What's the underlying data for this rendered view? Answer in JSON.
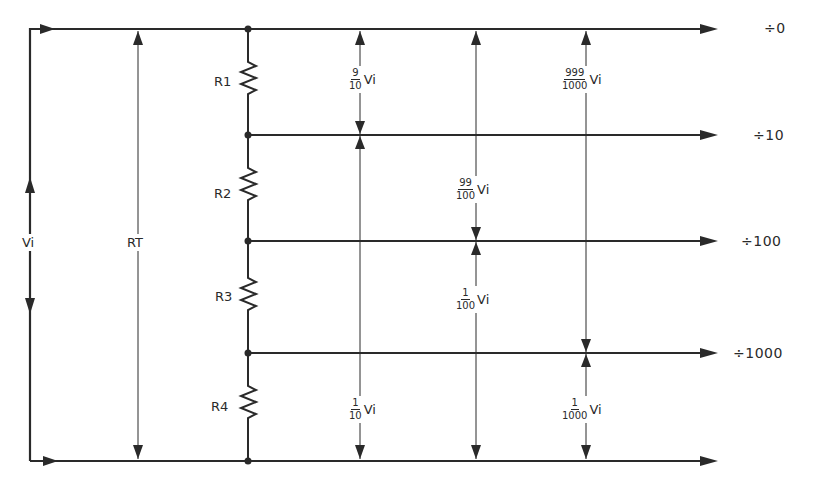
{
  "diagram": {
    "title": "",
    "input": {
      "voltage_label": "Vi",
      "total_resistance_label": "RT",
      "total_resistance_sub": "T"
    },
    "resistors": [
      {
        "label": "R1"
      },
      {
        "label": "R2"
      },
      {
        "label": "R3"
      },
      {
        "label": "R4"
      }
    ],
    "outputs": [
      {
        "label": "÷0"
      },
      {
        "label": "÷10"
      },
      {
        "label": "÷100"
      },
      {
        "label": "÷1000"
      }
    ],
    "dimensions": {
      "col1": [
        {
          "num": "9",
          "den": "10",
          "var": "Vi",
          "span": "top to ÷10"
        },
        {
          "num": "1",
          "den": "10",
          "var": "Vi",
          "span": "÷10 to bottom"
        }
      ],
      "col2": [
        {
          "num": "99",
          "den": "100",
          "var": "Vi",
          "span": "top to ÷100"
        },
        {
          "num": "1",
          "den": "100",
          "var": "Vi",
          "span": "÷100 to bottom"
        }
      ],
      "col3": [
        {
          "num": "999",
          "den": "1000",
          "var": "Vi",
          "span": "top to ÷1000"
        },
        {
          "num": "1",
          "den": "1000",
          "var": "Vi",
          "span": "÷1000 to bottom"
        }
      ]
    },
    "colors": {
      "line": "#2a2a2a",
      "background": "#ffffff"
    }
  }
}
